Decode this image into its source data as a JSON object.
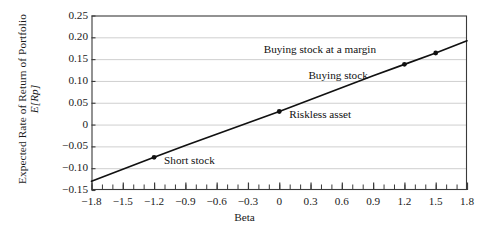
{
  "chart_data": {
    "type": "line",
    "title": "",
    "xlabel": "Beta",
    "ylabel_line1": "Expected Rate of Return of Portfolio",
    "ylabel_line2": "E[Rp]",
    "xlim": [
      -1.8,
      1.8
    ],
    "ylim": [
      -0.15,
      0.25
    ],
    "grid": "horizontal",
    "legend": "none",
    "xticks": [
      "−1.8",
      "−1.5",
      "−1.2",
      "−0.9",
      "−0.6",
      "−0.3",
      "0",
      "0.3",
      "0.6",
      "0.9",
      "1.2",
      "1.5",
      "1.8"
    ],
    "xtick_values": [
      -1.8,
      -1.5,
      -1.2,
      -0.9,
      -0.6,
      -0.3,
      0,
      0.3,
      0.6,
      0.9,
      1.2,
      1.5,
      1.8
    ],
    "xminor_step": 0.1,
    "yticks": [
      "0.25",
      "0.20",
      "0.15",
      "0.10",
      "0.05",
      "0",
      "−0.05",
      "−0.10",
      "−0.15"
    ],
    "ytick_values": [
      0.25,
      0.2,
      0.15,
      0.1,
      0.05,
      0,
      -0.05,
      -0.1,
      -0.15
    ],
    "series": [
      {
        "name": "Security Market Line",
        "color": "#111111",
        "x": [
          -1.8,
          -1.2,
          -0.9,
          0,
          0.9,
          1.2,
          1.5,
          1.8
        ],
        "y": [
          -0.13,
          -0.075,
          -0.048,
          0.03,
          0.112,
          0.138,
          0.164,
          0.192
        ]
      }
    ],
    "points": [
      {
        "label": "Short stock",
        "x": -1.2,
        "y": -0.075,
        "label_dx": 10,
        "label_dy": 4
      },
      {
        "label": "Riskless asset",
        "x": 0.0,
        "y": 0.03,
        "label_dx": 10,
        "label_dy": 4
      },
      {
        "label": "Buying stock",
        "x": 1.2,
        "y": 0.138,
        "label_dx": -96,
        "label_dy": 12
      },
      {
        "label": "Buying stock at a margin",
        "x": 1.5,
        "y": 0.164,
        "label_dx": -172,
        "label_dy": -3
      }
    ],
    "colors": {
      "line": "#111111",
      "frame": "#3a3a3a",
      "grid": "#c9c9c9",
      "background": "#ffffff",
      "text": "#1a1a1a"
    }
  }
}
